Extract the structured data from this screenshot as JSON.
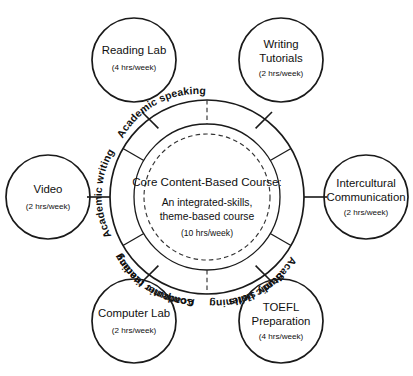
{
  "diagram": {
    "core": {
      "title": "Core Content-Based Course:",
      "line1": "An integrated-skills,",
      "line2": "theme-based course",
      "hours": "(10 hrs/week)"
    },
    "ring_segments": [
      {
        "id": "academic-reading",
        "label": "Academic reading"
      },
      {
        "id": "academic-writing",
        "label": "Academic writing"
      },
      {
        "id": "academic-speaking",
        "label": "Academic speaking"
      },
      {
        "id": "study-skills",
        "label": "Study skills"
      },
      {
        "id": "computer-literacy",
        "label": "Computer literacy"
      },
      {
        "id": "academic-listening",
        "label": "Academic listening"
      }
    ],
    "satellites": [
      {
        "id": "reading-lab",
        "line1": "Reading Lab",
        "line2": "",
        "hours": "(4 hrs/week)"
      },
      {
        "id": "writing-tutorials",
        "line1": "Writing",
        "line2": "Tutorials",
        "hours": "(2 hrs/week)"
      },
      {
        "id": "intercultural-communication",
        "line1": "Intercultural",
        "line2": "Communication",
        "hours": "(2 hrs/week)"
      },
      {
        "id": "toefl-preparation",
        "line1": "TOEFL",
        "line2": "Preparation",
        "hours": "(4 hrs/week)"
      },
      {
        "id": "computer-lab",
        "line1": "Computer Lab",
        "line2": "",
        "hours": "(2 hrs/week)"
      },
      {
        "id": "video",
        "line1": "Video",
        "line2": "",
        "hours": "(2 hrs/week)"
      }
    ],
    "colors": {
      "stroke": "#1a1a1a",
      "dashed": "#333333",
      "background": "#ffffff",
      "text": "#101010"
    }
  }
}
